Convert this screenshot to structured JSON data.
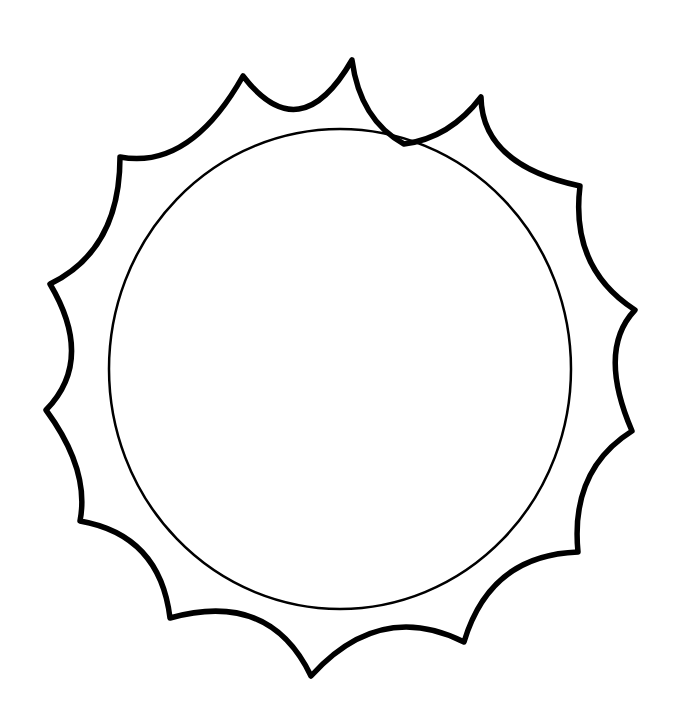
{
  "image": {
    "subject": "sun outline coloring page",
    "background": "#ffffff",
    "stroke": "#000000",
    "rays": 14,
    "inner_circle": {
      "cx": 340,
      "cy": 369,
      "rx": 231,
      "ry": 240
    }
  }
}
